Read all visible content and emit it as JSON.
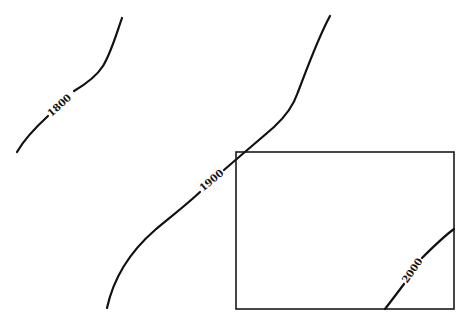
{
  "diagram": {
    "type": "contour-map",
    "stroke_color": "#111111",
    "background": "#ffffff",
    "contours": [
      {
        "label": "1800",
        "label_x": 60,
        "label_y": 106,
        "label_angle": -42
      },
      {
        "label": "1900",
        "label_x": 212,
        "label_y": 181,
        "label_angle": -40
      },
      {
        "label": "2000",
        "label_x": 413,
        "label_y": 271,
        "label_angle": -55
      }
    ],
    "frame": {
      "x": 236,
      "y": 152,
      "width": 218,
      "height": 157
    }
  }
}
